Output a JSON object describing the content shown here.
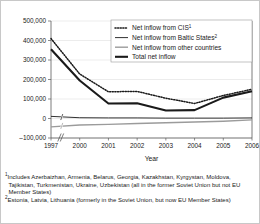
{
  "chart_data": {
    "type": "line",
    "title": "",
    "xlabel": "Year",
    "ylabel": "",
    "x": [
      "1997",
      "2000",
      "2001",
      "2002",
      "2003",
      "2004",
      "2005",
      "2006"
    ],
    "axis_break_after": "1997",
    "ylim": [
      -100000,
      500000
    ],
    "ytick_values": [
      500000,
      400000,
      300000,
      200000,
      100000,
      0,
      -100000
    ],
    "ytick_labels": [
      "500,000",
      "400,000",
      "300,000",
      "200,000",
      "100,000",
      "0",
      "–100,000"
    ],
    "grid": true,
    "legend_position": "top-right",
    "series": [
      {
        "name": "Net inflow from CIS",
        "footnote_marker": "1",
        "style": "dotted",
        "color": "#1a1a1a",
        "values": [
          410000,
          228000,
          137000,
          139000,
          104000,
          77000,
          118000,
          150000
        ]
      },
      {
        "name": "Net inflow from Baltic States",
        "footnote_marker": "2",
        "style": "thin-solid",
        "color": "#1a1a1a",
        "values": [
          11000,
          4000,
          3000,
          3000,
          2000,
          2000,
          2000,
          3000
        ]
      },
      {
        "name": "Net inflow from other countries",
        "footnote_marker": "",
        "style": "gray-solid",
        "color": "#9b9b9b",
        "values": [
          -43000,
          -33000,
          -30000,
          -26000,
          -22000,
          -18000,
          -14000,
          -7000
        ]
      },
      {
        "name": "Total net inflow",
        "footnote_marker": "",
        "style": "thick-solid",
        "color": "#1a1a1a",
        "values": [
          355000,
          195000,
          77000,
          78000,
          41000,
          43000,
          107000,
          140000
        ]
      }
    ]
  },
  "legend": {
    "items": [
      {
        "label": "Net inflow from CIS",
        "sup": "1",
        "marker": "dotted-line-icon"
      },
      {
        "label": "Net inflow from Baltic States",
        "sup": "2",
        "marker": "thin-line-icon"
      },
      {
        "label": "Net inflow from other countries",
        "sup": "",
        "marker": "gray-line-icon"
      },
      {
        "label": "Total net inflow",
        "sup": "",
        "marker": "thick-line-icon"
      }
    ]
  },
  "footnotes": [
    {
      "marker": "1",
      "text": "Includes Azerbaizhan, Armenia, Belarus, Georgia, Kazakhstan, Kyrgystan, Moldova, Tajikistan, Turkmenistan, Ukraine, Uzbekistan (all in the former Soviet Union but not EU Member States)"
    },
    {
      "marker": "2",
      "text": "Estonia, Latvia, Lithuania (formerly in the Soviet Union, but now EU Member States)"
    }
  ],
  "colors": {
    "grid": "#d9d9d9",
    "axis": "#5a5a5a",
    "primary": "#1a1a1a",
    "secondary": "#9b9b9b",
    "background": "#ffffff",
    "border": "#c8c8c8"
  }
}
